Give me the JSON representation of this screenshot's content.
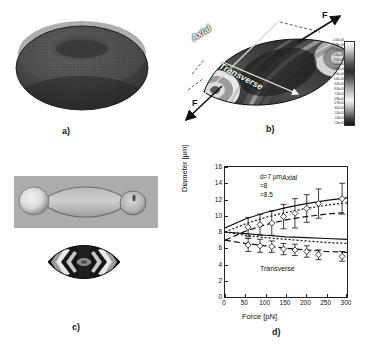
{
  "figure": {
    "panels": [
      {
        "id": "a",
        "label": "a)",
        "caption": "3D meshed red blood cell torus model"
      },
      {
        "id": "b",
        "label": "b)",
        "caption": "Stretched cell with axial and transverse axes and applied force F"
      },
      {
        "id": "c",
        "label": "c)",
        "caption": "Experimental microscopy image and simulated contour"
      },
      {
        "id": "d",
        "label": "d)",
        "caption": "Diameter versus force plot"
      }
    ]
  },
  "panel_b": {
    "axis_labels": {
      "axial": "Axial",
      "transverse": "Transverse"
    },
    "force_label_top": "F",
    "force_label_bottom": "F",
    "colorbar": {
      "ticks": [
        "2.00e+00",
        "1.88e+00",
        "1.77e+00",
        "1.65e+00",
        "1.53e+00",
        "1.42e+00",
        "1.30e+00",
        "1.18e+00",
        "1.06e+00",
        "9.47e-01",
        "8.30e-01",
        "7.13e-01",
        "5.96e-01",
        "4.79e-01",
        "3.62e-01",
        "2.45e-01",
        "1.28e-01",
        "1.00e-02"
      ],
      "max": "2.00e+00",
      "min": "1.00e-02"
    }
  },
  "panel_d": {
    "legend": [
      {
        "label": "d=7 µm",
        "style": "dashed"
      },
      {
        "label": "=8",
        "style": "dotted"
      },
      {
        "label": "=8.5",
        "style": "solid"
      }
    ],
    "annotations": {
      "axial": "Axial",
      "transverse": "Transverse"
    }
  },
  "chart_data": {
    "type": "line",
    "title": "",
    "xlabel": "Force [pN]",
    "ylabel": "Diameter [µm]",
    "xlim": [
      0,
      300
    ],
    "ylim": [
      0,
      16
    ],
    "xticks": [
      0,
      50,
      100,
      150,
      200,
      250,
      300
    ],
    "yticks": [
      0,
      2,
      4,
      6,
      8,
      10,
      12,
      14,
      16
    ],
    "grid": false,
    "legend_position": "upper-left",
    "legend_entries": [
      "d=7 µm",
      "=8",
      "=8.5"
    ],
    "annotations": [
      {
        "text": "Axial",
        "x": 218,
        "y": 13.4
      },
      {
        "text": "Transverse",
        "x": 180,
        "y": 3.6
      }
    ],
    "series": [
      {
        "name": "Axial measured",
        "type": "scatter-errorbar",
        "marker": "diamond",
        "x": [
          57,
          86,
          115,
          144,
          172,
          201,
          230,
          288
        ],
        "y": [
          8.6,
          8.9,
          9.1,
          9.9,
          10.3,
          10.9,
          11.5,
          12.1
        ],
        "yerr": [
          1.2,
          1.3,
          1.5,
          1.5,
          1.8,
          1.7,
          1.8,
          1.9
        ]
      },
      {
        "name": "Transverse measured",
        "type": "scatter-errorbar",
        "marker": "diamond",
        "x": [
          57,
          86,
          115,
          144,
          172,
          201,
          230,
          288
        ],
        "y": [
          6.4,
          6.3,
          6.2,
          5.9,
          5.8,
          5.6,
          5.2,
          5.0
        ],
        "yerr": [
          0.8,
          0.8,
          0.7,
          0.7,
          0.7,
          0.7,
          0.6,
          0.6
        ]
      },
      {
        "name": "Axial d=7 µm",
        "type": "line",
        "style": "dashed",
        "x": [
          0,
          50,
          100,
          150,
          200,
          250,
          300
        ],
        "y": [
          7.0,
          8.1,
          8.9,
          9.5,
          9.9,
          10.2,
          10.4
        ]
      },
      {
        "name": "Axial d=8 µm",
        "type": "line",
        "style": "dotted",
        "x": [
          0,
          50,
          100,
          150,
          200,
          250,
          300
        ],
        "y": [
          8.0,
          9.0,
          9.8,
          10.4,
          10.9,
          11.3,
          11.6
        ]
      },
      {
        "name": "Axial d=8.5 µm",
        "type": "line",
        "style": "solid",
        "x": [
          0,
          50,
          100,
          150,
          200,
          250,
          300
        ],
        "y": [
          8.5,
          9.6,
          10.4,
          11.0,
          11.5,
          11.9,
          12.2
        ]
      },
      {
        "name": "Transverse d=7 µm",
        "type": "line",
        "style": "dashed",
        "x": [
          0,
          50,
          100,
          150,
          200,
          250,
          300
        ],
        "y": [
          7.0,
          6.6,
          6.3,
          6.0,
          5.8,
          5.6,
          5.5
        ]
      },
      {
        "name": "Transverse d=8 µm",
        "type": "line",
        "style": "dotted",
        "x": [
          0,
          50,
          100,
          150,
          200,
          250,
          300
        ],
        "y": [
          8.0,
          7.6,
          7.3,
          7.1,
          6.9,
          6.7,
          6.6
        ]
      },
      {
        "name": "Transverse d=8.5 µm",
        "type": "line",
        "style": "solid",
        "x": [
          0,
          50,
          100,
          150,
          200,
          250,
          300
        ],
        "y": [
          8.0,
          7.8,
          7.6,
          7.4,
          7.3,
          7.2,
          7.1
        ]
      }
    ]
  },
  "colors": {
    "axis": "#222222",
    "text": "#111111",
    "background": "#ffffff"
  }
}
